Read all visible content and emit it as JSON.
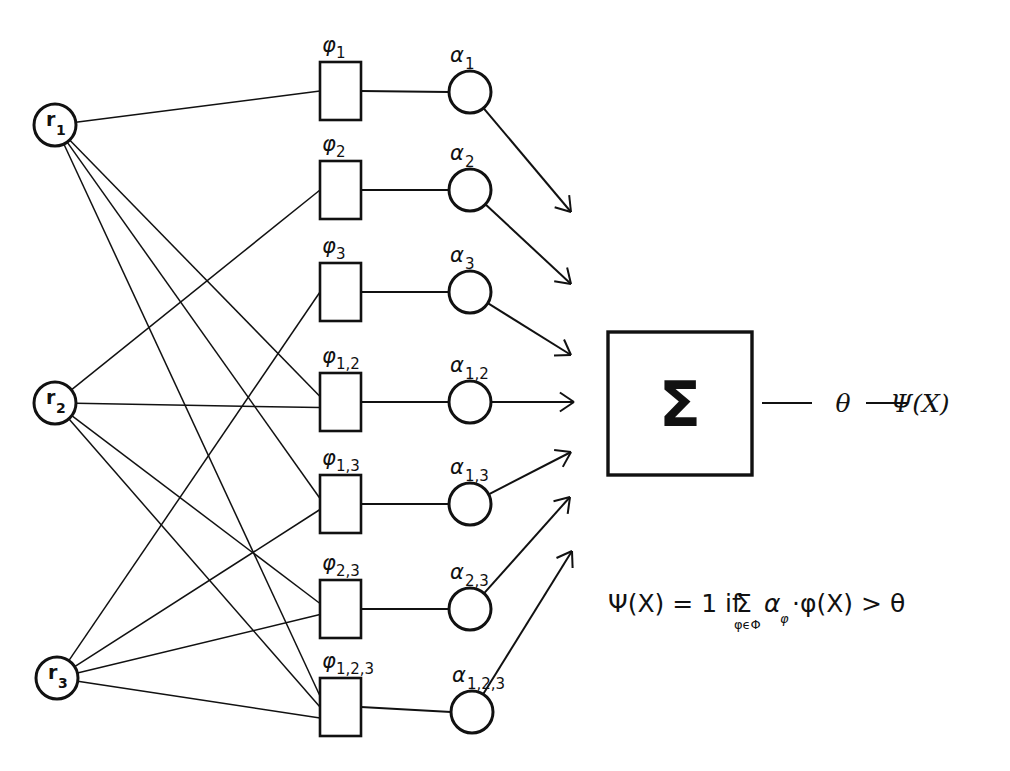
{
  "figure": {
    "background_color": "#ffffff",
    "ink_color": "#111111"
  },
  "input_nodes": [
    {
      "id": "r1",
      "base": "r",
      "sub": "1",
      "cx": 55,
      "cy": 125,
      "r": 21
    },
    {
      "id": "r2",
      "base": "r",
      "sub": "2",
      "cx": 55,
      "cy": 403,
      "r": 21
    },
    {
      "id": "r3",
      "base": "r",
      "sub": "3",
      "cx": 57,
      "cy": 678,
      "r": 21
    }
  ],
  "feature_boxes": [
    {
      "id": "phi1",
      "base": "φ",
      "sub": "1",
      "x": 320,
      "y": 62,
      "w": 41,
      "h": 58,
      "members": [
        "r1"
      ]
    },
    {
      "id": "phi2",
      "base": "φ",
      "sub": "2",
      "x": 320,
      "y": 161,
      "w": 41,
      "h": 58,
      "members": [
        "r2"
      ]
    },
    {
      "id": "phi3",
      "base": "φ",
      "sub": "3",
      "x": 320,
      "y": 263,
      "w": 41,
      "h": 58,
      "members": [
        "r3"
      ]
    },
    {
      "id": "phi12",
      "base": "φ",
      "sub": "1,2",
      "x": 320,
      "y": 373,
      "w": 41,
      "h": 58,
      "members": [
        "r1",
        "r2"
      ]
    },
    {
      "id": "phi13",
      "base": "φ",
      "sub": "1,3",
      "x": 320,
      "y": 475,
      "w": 41,
      "h": 58,
      "members": [
        "r1",
        "r3"
      ]
    },
    {
      "id": "phi23",
      "base": "φ",
      "sub": "2,3",
      "x": 320,
      "y": 580,
      "w": 41,
      "h": 58,
      "members": [
        "r2",
        "r3"
      ]
    },
    {
      "id": "phi123",
      "base": "φ",
      "sub": "1,2,3",
      "x": 320,
      "y": 678,
      "w": 41,
      "h": 58,
      "members": [
        "r1",
        "r2",
        "r3"
      ]
    }
  ],
  "weight_nodes": [
    {
      "id": "a1",
      "base": "α",
      "sub": "1",
      "cx": 470,
      "cy": 92,
      "r": 21,
      "arrow_dir": "down"
    },
    {
      "id": "a2",
      "base": "α",
      "sub": "2",
      "cx": 470,
      "cy": 190,
      "r": 21,
      "arrow_dir": "down"
    },
    {
      "id": "a3",
      "base": "α",
      "sub": "3",
      "cx": 470,
      "cy": 292,
      "r": 21,
      "arrow_dir": "down"
    },
    {
      "id": "a12",
      "base": "α",
      "sub": "1,2",
      "cx": 470,
      "cy": 402,
      "r": 21,
      "arrow_dir": "straight"
    },
    {
      "id": "a13",
      "base": "α",
      "sub": "1,3",
      "cx": 470,
      "cy": 504,
      "r": 21,
      "arrow_dir": "up"
    },
    {
      "id": "a23",
      "base": "α",
      "sub": "2,3",
      "cx": 470,
      "cy": 609,
      "r": 21,
      "arrow_dir": "up"
    },
    {
      "id": "a123",
      "base": "α",
      "sub": "1,2,3",
      "cx": 472,
      "cy": 712,
      "r": 21,
      "arrow_dir": "up"
    }
  ],
  "arrow_targets": [
    {
      "from": "a1",
      "x": 571,
      "y": 212
    },
    {
      "from": "a2",
      "x": 571,
      "y": 284
    },
    {
      "from": "a3",
      "x": 571,
      "y": 355
    },
    {
      "from": "a12",
      "x": 574,
      "y": 402
    },
    {
      "from": "a13",
      "x": 571,
      "y": 452
    },
    {
      "from": "a23",
      "x": 570,
      "y": 497
    },
    {
      "from": "a123",
      "x": 572,
      "y": 551
    }
  ],
  "summation": {
    "glyph": "Σ",
    "x": 608,
    "y": 332,
    "w": 144,
    "h": 143
  },
  "output_chain": {
    "theta_label": "θ",
    "theta_x": 843,
    "output_label": "Ψ(X)",
    "output_x": 920,
    "y": 403,
    "dash1": {
      "x1": 762,
      "x2": 812
    },
    "dash2": {
      "x1": 866,
      "x2": 908
    }
  },
  "formula": {
    "x": 608,
    "y": 612,
    "parts": {
      "lhs": "Ψ(X) = 1 if",
      "sigma": "Σ",
      "sigma_sub": "φϵΦ",
      "alpha": "α",
      "alpha_sub": "φ",
      "rest": "·φ(X) > θ"
    },
    "plain_text": "Ψ(X) = 1 if Σ(φϵΦ) α_φ · φ(X) > θ"
  }
}
